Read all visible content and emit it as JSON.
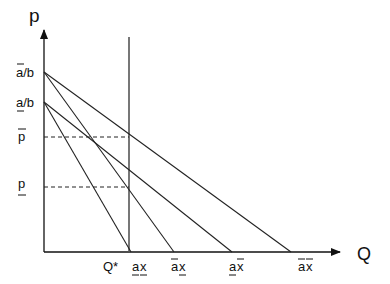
{
  "diagram": {
    "type": "economics-demand-diagram",
    "axes": {
      "y_label": "p",
      "x_label": "Q"
    },
    "y_ticks": [
      {
        "id": "abar_over_b",
        "base": "a",
        "bar": "over",
        "suffix": "/b",
        "y": 72
      },
      {
        "id": "aunder_over_b",
        "base": "a",
        "bar": "under",
        "suffix": "/b",
        "y": 102
      },
      {
        "id": "pbar",
        "base": "p",
        "bar": "over",
        "suffix": "",
        "y": 137
      },
      {
        "id": "punder",
        "base": "p",
        "bar": "under",
        "suffix": "",
        "y": 187
      }
    ],
    "x_ticks": [
      {
        "id": "qstar",
        "text": "Q*",
        "x": 117
      },
      {
        "id": "aunder_xunder",
        "a_bar": "under",
        "x_bar": "under",
        "x": 138
      },
      {
        "id": "abar_xunder",
        "a_bar": "over",
        "x_bar": "under",
        "x": 181
      },
      {
        "id": "aunder_xbar",
        "a_bar": "under",
        "x_bar": "over",
        "x": 239
      },
      {
        "id": "abar_xbar",
        "a_bar": "over",
        "x_bar": "over",
        "x": 306
      }
    ],
    "demand_lines": [
      {
        "name": "abar-xbar",
        "from": [
          44,
          72
        ],
        "to": [
          291,
          252
        ]
      },
      {
        "name": "abar-xunder",
        "from": [
          44,
          72
        ],
        "to": [
          174,
          252
        ]
      },
      {
        "name": "aunder-xbar",
        "from": [
          44,
          102
        ],
        "to": [
          232,
          252
        ]
      },
      {
        "name": "aunder-xunder",
        "from": [
          44,
          102
        ],
        "to": [
          131,
          252
        ]
      }
    ],
    "quantity_line": {
      "label": "Q*",
      "x": 129,
      "y_top": 37,
      "y_bottom": 252
    },
    "price_lines": [
      {
        "label": "p-bar",
        "y": 137,
        "x_end": 129
      },
      {
        "label": "p-under",
        "y": 187,
        "x_end": 129
      }
    ],
    "colors": {
      "line": "#222222",
      "quantity_line": "#555555",
      "background": "#ffffff"
    }
  }
}
